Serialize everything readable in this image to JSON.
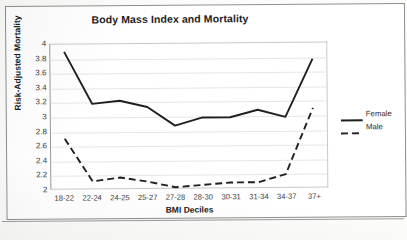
{
  "chart_data": {
    "type": "line",
    "title": "Body Mass Index and Mortality",
    "xlabel": "BMI Deciles",
    "ylabel": "Risk-Adjusted Mortality",
    "categories": [
      "18-22",
      "22-24",
      "24-25",
      "25-27",
      "27-28",
      "28-30",
      "30-31",
      "31-34",
      "34-37",
      "37+"
    ],
    "series": [
      {
        "name": "Female",
        "style": "solid",
        "color": "#1f1f1f",
        "values": [
          3.9,
          3.18,
          3.22,
          3.13,
          2.87,
          2.98,
          2.98,
          3.08,
          2.98,
          3.78
        ]
      },
      {
        "name": "Male",
        "style": "dashed",
        "color": "#1f1f1f",
        "values": [
          2.7,
          2.11,
          2.16,
          2.1,
          2.02,
          2.05,
          2.08,
          2.08,
          2.19,
          3.1
        ]
      }
    ],
    "ylim": [
      2,
      4
    ],
    "ytick_step": 0.2,
    "yticks": [
      "4",
      "3.8",
      "3.6",
      "3.4",
      "3.2",
      "3",
      "2.8",
      "2.6",
      "2.4",
      "2.2",
      "2"
    ],
    "grid": true,
    "legend_position": "right"
  }
}
